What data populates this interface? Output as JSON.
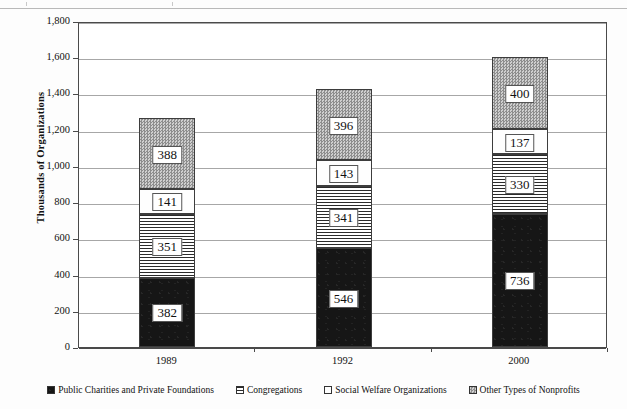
{
  "chart_data": {
    "type": "bar",
    "stacked": true,
    "title": "",
    "subtitle": "",
    "xlabel": "",
    "ylabel": "Thousands of Organizations",
    "categories": [
      "1989",
      "1992",
      "2000"
    ],
    "ylim": [
      0,
      1800
    ],
    "ytick_labels": [
      "0",
      "200",
      "400",
      "600",
      "800",
      "1,000",
      "1,200",
      "1,400",
      "1,600",
      "1,800"
    ],
    "ytick_values": [
      0,
      200,
      400,
      600,
      800,
      1000,
      1200,
      1400,
      1600,
      1800
    ],
    "grid": true,
    "legend_position": "bottom",
    "series": [
      {
        "name": "Public Charities and Private Foundations",
        "pattern": "solid-black",
        "color": "#161616",
        "values": [
          382,
          546,
          736
        ],
        "labels": [
          "382",
          "546",
          "736"
        ]
      },
      {
        "name": "Congregations",
        "pattern": "horizontal-lines",
        "color": "#2b2b2b",
        "values": [
          351,
          341,
          330
        ],
        "labels": [
          "351",
          "341",
          "330"
        ]
      },
      {
        "name": "Social Welfare Organizations",
        "pattern": "white",
        "color": "#fefefe",
        "values": [
          141,
          143,
          137
        ],
        "labels": [
          "141",
          "143",
          "137"
        ]
      },
      {
        "name": "Other Types of Nonprofits",
        "pattern": "gray-checker",
        "color": "#b6b6b6",
        "values": [
          388,
          396,
          400
        ],
        "labels": [
          "388",
          "396",
          "400"
        ]
      }
    ],
    "totals": [
      1262,
      1426,
      1603
    ]
  },
  "axis": {
    "y_title": "Thousands of Organizations",
    "y_ticks": [
      {
        "label": "1,800",
        "value": 1800
      },
      {
        "label": "1,600",
        "value": 1600
      },
      {
        "label": "1,400",
        "value": 1400
      },
      {
        "label": "1,200",
        "value": 1200
      },
      {
        "label": "1,000",
        "value": 1000
      },
      {
        "label": "800",
        "value": 800
      },
      {
        "label": "600",
        "value": 600
      },
      {
        "label": "400",
        "value": 400
      },
      {
        "label": "200",
        "value": 200
      },
      {
        "label": "0",
        "value": 0
      }
    ],
    "x_ticks": [
      {
        "label": "1989"
      },
      {
        "label": "1992"
      },
      {
        "label": "2000"
      }
    ]
  },
  "legend": {
    "items": [
      {
        "label": "Public Charities and Private Foundations",
        "pattern": "solid-black"
      },
      {
        "label": "Congregations",
        "pattern": "horizontal-lines"
      },
      {
        "label": "Social Welfare Organizations",
        "pattern": "white"
      },
      {
        "label": "Other Types of Nonprofits",
        "pattern": "gray-checker"
      }
    ]
  }
}
